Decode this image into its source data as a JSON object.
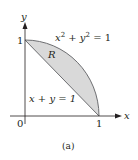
{
  "figure": {
    "caption": "(a)",
    "axes": {
      "x_label": "x",
      "y_label": "y",
      "origin_label": "0",
      "x_tick_label": "1",
      "y_tick_label": "1"
    },
    "curves": {
      "circle_label_base_x": "x",
      "circle_label_exp_x": "2",
      "circle_label_mid": " + ",
      "circle_label_base_y": "y",
      "circle_label_exp_y": "2",
      "circle_label_rhs": " = 1",
      "line_label": "x + y = 1"
    },
    "region_label": "R",
    "colors": {
      "region_fill": "#d9d9d9",
      "stroke": "#231f20",
      "background": "#ffffff"
    }
  }
}
